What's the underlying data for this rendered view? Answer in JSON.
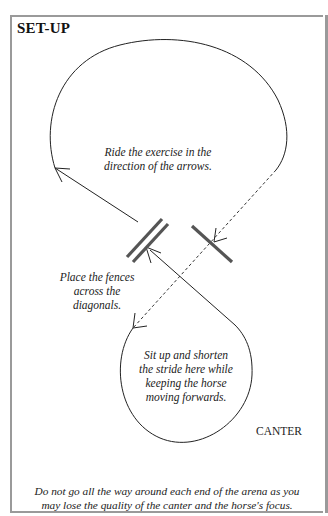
{
  "title": "SET-UP",
  "notes": {
    "direction": [
      "Ride the exercise in the",
      "direction of the arrows."
    ],
    "fences": [
      "Place the fences",
      "across the",
      "diagonals."
    ],
    "stride": [
      "Sit up and shorten",
      "the stride here while",
      "keeping the horse",
      "moving forwards."
    ]
  },
  "gait_label": "CANTER",
  "footer": [
    "Do not go all the way around each end of the arena as you",
    "may lose the quality of the canter and the horse's focus."
  ],
  "colors": {
    "border": "#9a9a9a",
    "fence": "#555555",
    "line": "#222222"
  }
}
